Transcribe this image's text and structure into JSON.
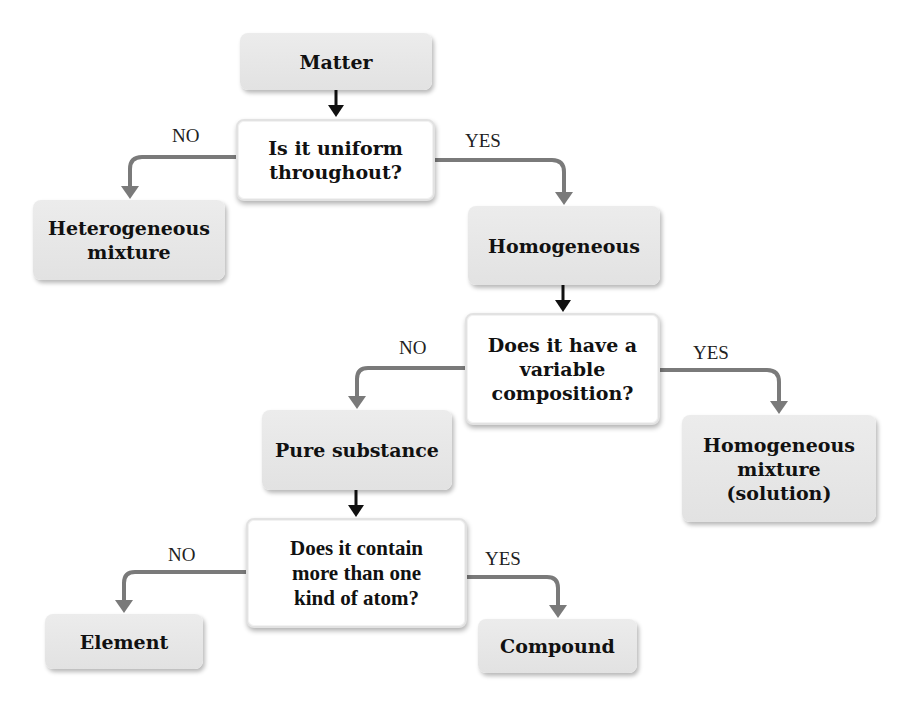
{
  "diagram": {
    "type": "flowchart",
    "topic": "Classification of matter",
    "colors": {
      "outcome_box_fill": "#e6e6e6",
      "question_box_fill": "#ffffff",
      "main_arrow": "#111111",
      "branch_arrow": "#7a7a7a",
      "text": "#111111"
    },
    "nodes": {
      "matter": {
        "text": "Matter",
        "kind": "outcome"
      },
      "q_uniform": {
        "text": "Is it uniform\nthroughout?",
        "kind": "question"
      },
      "heterogeneous": {
        "text": "Heterogeneous\nmixture",
        "kind": "outcome"
      },
      "homogeneous": {
        "text": "Homogeneous",
        "kind": "outcome"
      },
      "q_variable": {
        "text": "Does it have a\nvariable\ncomposition?",
        "kind": "question"
      },
      "pure_substance": {
        "text": "Pure substance",
        "kind": "outcome"
      },
      "homogeneous_mixture": {
        "text": "Homogeneous\nmixture\n(solution)",
        "kind": "outcome"
      },
      "q_atoms": {
        "text": "Does it contain\nmore than one\nkind of atom?",
        "kind": "question"
      },
      "element": {
        "text": "Element",
        "kind": "outcome"
      },
      "compound": {
        "text": "Compound",
        "kind": "outcome"
      }
    },
    "edge_labels": {
      "uniform_no": "NO",
      "uniform_yes": "YES",
      "variable_no": "NO",
      "variable_yes": "YES",
      "atoms_no": "NO",
      "atoms_yes": "YES"
    },
    "edges": [
      {
        "from": "matter",
        "to": "q_uniform",
        "label": ""
      },
      {
        "from": "q_uniform",
        "to": "heterogeneous",
        "label": "NO"
      },
      {
        "from": "q_uniform",
        "to": "homogeneous",
        "label": "YES"
      },
      {
        "from": "homogeneous",
        "to": "q_variable",
        "label": ""
      },
      {
        "from": "q_variable",
        "to": "pure_substance",
        "label": "NO"
      },
      {
        "from": "q_variable",
        "to": "homogeneous_mixture",
        "label": "YES"
      },
      {
        "from": "pure_substance",
        "to": "q_atoms",
        "label": ""
      },
      {
        "from": "q_atoms",
        "to": "element",
        "label": "NO"
      },
      {
        "from": "q_atoms",
        "to": "compound",
        "label": "YES"
      }
    ]
  }
}
